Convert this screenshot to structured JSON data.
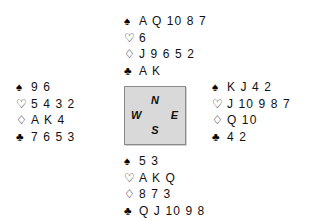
{
  "diagram": {
    "kind": "bridge-deal-diagram",
    "background_color": "#ffffff",
    "text_color": "#111111"
  },
  "suits": {
    "spade": {
      "name": "spade-suit-symbol",
      "glyph": "♠",
      "filled": true
    },
    "heart": {
      "name": "heart-suit-symbol",
      "glyph": "♡",
      "filled": false
    },
    "diamond": {
      "name": "diamond-suit-symbol",
      "glyph": "♢",
      "filled": false
    },
    "club": {
      "name": "club-suit-symbol",
      "glyph": "♣",
      "filled": true
    }
  },
  "hands": {
    "north": {
      "label": "North",
      "spades": "A Q 10 8 7",
      "hearts": "6",
      "diamonds": "J 9 6 5 2",
      "clubs": "A K"
    },
    "west": {
      "label": "West",
      "spades": "9 6",
      "hearts": "5 4 3 2",
      "diamonds": "A K 4",
      "clubs": "7 6 5 3"
    },
    "east": {
      "label": "East",
      "spades": "K J 4 2",
      "hearts": "J 10 9 8 7",
      "diamonds": "Q 10",
      "clubs": "4 2"
    },
    "south": {
      "label": "South",
      "spades": "5 3",
      "hearts": "A K Q",
      "diamonds": "8 7 3",
      "clubs": "Q J 10 9 8"
    }
  },
  "compass": {
    "north": "N",
    "east": "E",
    "south": "S",
    "west": "W",
    "fill_color": "#d9d9d9",
    "border_color": "#8a8a8a"
  }
}
